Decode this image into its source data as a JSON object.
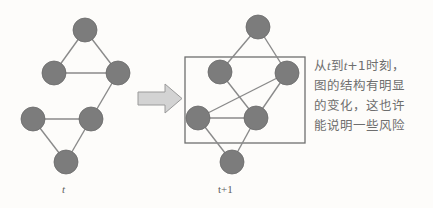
{
  "figure": {
    "type": "diagram",
    "background_color": "#fdfcfa",
    "node_color": "#7c7c7c",
    "node_stroke_color": "#6b6b6b",
    "edge_color": "#8a8a8a",
    "box_stroke_color": "#6f6f6f",
    "arrow_fill_color": "#d3d3d3",
    "arrow_stroke_color": "#9a9a9a",
    "text_color": "#6e6e6e",
    "node_radius": 12
  },
  "left_graph": {
    "caption": "t",
    "caption_italic": true,
    "nodes": [
      {
        "id": "a",
        "cx": 85,
        "cy": 30
      },
      {
        "id": "b",
        "cx": 54,
        "cy": 73
      },
      {
        "id": "c",
        "cx": 118,
        "cy": 73
      },
      {
        "id": "d",
        "cx": 33,
        "cy": 119
      },
      {
        "id": "e",
        "cx": 91,
        "cy": 119
      },
      {
        "id": "f",
        "cx": 66,
        "cy": 162
      }
    ],
    "edges": [
      [
        "a",
        "b"
      ],
      [
        "a",
        "c"
      ],
      [
        "b",
        "c"
      ],
      [
        "c",
        "e"
      ],
      [
        "d",
        "e"
      ],
      [
        "d",
        "f"
      ],
      [
        "e",
        "f"
      ]
    ]
  },
  "arrow": {
    "label": "transition-arrow",
    "direction": "right",
    "x": 138,
    "y": 84,
    "width": 44,
    "height": 29
  },
  "right_graph": {
    "caption": "t+1",
    "caption_italic_var": "t",
    "nodes": [
      {
        "id": "a",
        "cx": 258,
        "cy": 27
      },
      {
        "id": "b",
        "cx": 220,
        "cy": 72
      },
      {
        "id": "c",
        "cx": 287,
        "cy": 73
      },
      {
        "id": "d",
        "cx": 198,
        "cy": 118
      },
      {
        "id": "e",
        "cx": 256,
        "cy": 118
      },
      {
        "id": "f",
        "cx": 232,
        "cy": 162
      }
    ],
    "edges": [
      [
        "a",
        "b"
      ],
      [
        "a",
        "c"
      ],
      [
        "b",
        "e"
      ],
      [
        "c",
        "d"
      ],
      [
        "c",
        "e"
      ],
      [
        "d",
        "e"
      ],
      [
        "d",
        "f"
      ],
      [
        "e",
        "f"
      ]
    ],
    "highlight_box": {
      "x": 185,
      "y": 57,
      "width": 120,
      "height": 86
    }
  },
  "annotation": {
    "lines": [
      "从t到t+1时刻，",
      "图的结构有明显",
      "的变化，这也许",
      "能说明一些风险"
    ],
    "line1_parts": {
      "p1": "从",
      "v1": "t",
      "p2": "到",
      "v2": "t",
      "p3": "+1时刻，"
    }
  }
}
